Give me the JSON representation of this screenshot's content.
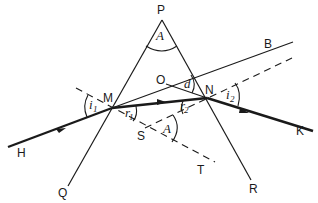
{
  "diagram": {
    "type": "prism-refraction",
    "points": {
      "P": "P",
      "M": "M",
      "N": "N",
      "O": "O",
      "S": "S",
      "Q": "Q",
      "R": "R",
      "H": "H",
      "K": "K",
      "B": "B",
      "T": "T"
    },
    "angles": {
      "apex": "A",
      "apex_at_S": "A",
      "deviation": "d",
      "i1": "i",
      "i1_sub": "1",
      "r1": "r",
      "r1_sub": "1",
      "r2": "r",
      "r2_sub": "2",
      "i2": "i",
      "i2_sub": "2"
    },
    "colors": {
      "line": "#1a1a1a",
      "background": "#ffffff"
    }
  }
}
